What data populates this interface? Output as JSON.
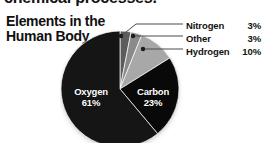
{
  "page": {
    "cut_off_heading": "chemical processes.",
    "background_color": "#ffffff"
  },
  "chart_data": {
    "type": "pie",
    "title": "Elements in the\nHuman Body",
    "title_line1": "Elements in the",
    "title_line2": "Human Body",
    "xlabel": "",
    "ylabel": "",
    "legend_position": "right",
    "grid": false,
    "unit": "%",
    "categories": [
      "Oxygen",
      "Carbon",
      "Hydrogen",
      "Other",
      "Nitrogen"
    ],
    "values": [
      61,
      23,
      10,
      3,
      3
    ],
    "slices": [
      {
        "name": "Oxygen",
        "value": 61,
        "value_label": "61%",
        "color": "#151515",
        "label_placement": "inside",
        "label_color": "#ffffff"
      },
      {
        "name": "Carbon",
        "value": 23,
        "value_label": "23%",
        "color": "#090909",
        "label_placement": "inside",
        "label_color": "#ffffff"
      },
      {
        "name": "Hydrogen",
        "value": 10,
        "value_label": "10%",
        "color": "#a8a8a8",
        "label_placement": "leader-legend",
        "label_color": "#111111"
      },
      {
        "name": "Other",
        "value": 3,
        "value_label": "3%",
        "color": "#8a8a8a",
        "label_placement": "leader-legend",
        "label_color": "#111111"
      },
      {
        "name": "Nitrogen",
        "value": 3,
        "value_label": "3%",
        "color": "#5c5c5c",
        "label_placement": "leader-legend",
        "label_color": "#111111"
      }
    ],
    "legend_entries": [
      {
        "name": "Nitrogen",
        "value_label": "3%"
      },
      {
        "name": "Other",
        "value_label": "3%"
      },
      {
        "name": "Hydrogen",
        "value_label": "10%"
      }
    ],
    "inside_labels": [
      {
        "name": "Oxygen",
        "value_label": "61%"
      },
      {
        "name": "Carbon",
        "value_label": "23%"
      }
    ]
  }
}
